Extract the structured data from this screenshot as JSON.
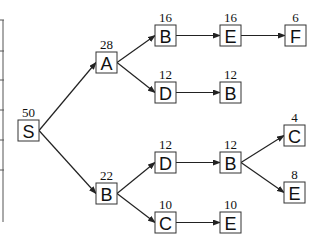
{
  "diagram": {
    "type": "tree",
    "direction": "left-to-right",
    "nodes": [
      {
        "id": "n0",
        "label": "S",
        "value": "50",
        "x": 18,
        "y": 120
      },
      {
        "id": "n1",
        "label": "A",
        "value": "28",
        "x": 96,
        "y": 52
      },
      {
        "id": "n2",
        "label": "B",
        "value": "22",
        "x": 96,
        "y": 183
      },
      {
        "id": "n3",
        "label": "B",
        "value": "16",
        "x": 155,
        "y": 25
      },
      {
        "id": "n4",
        "label": "D",
        "value": "12",
        "x": 155,
        "y": 82
      },
      {
        "id": "n5",
        "label": "E",
        "value": "16",
        "x": 220,
        "y": 25
      },
      {
        "id": "n6",
        "label": "F",
        "value": "6",
        "x": 285,
        "y": 25
      },
      {
        "id": "n7",
        "label": "B",
        "value": "12",
        "x": 220,
        "y": 82
      },
      {
        "id": "n8",
        "label": "D",
        "value": "12",
        "x": 155,
        "y": 152
      },
      {
        "id": "n9",
        "label": "B",
        "value": "12",
        "x": 220,
        "y": 152
      },
      {
        "id": "n10",
        "label": "C",
        "value": "4",
        "x": 284,
        "y": 125
      },
      {
        "id": "n11",
        "label": "E",
        "value": "8",
        "x": 284,
        "y": 182
      },
      {
        "id": "n12",
        "label": "C",
        "value": "10",
        "x": 155,
        "y": 212
      },
      {
        "id": "n13",
        "label": "E",
        "value": "10",
        "x": 220,
        "y": 212
      }
    ],
    "edges": [
      {
        "from": "n0",
        "to": "n1"
      },
      {
        "from": "n0",
        "to": "n2"
      },
      {
        "from": "n1",
        "to": "n3"
      },
      {
        "from": "n1",
        "to": "n4"
      },
      {
        "from": "n3",
        "to": "n5"
      },
      {
        "from": "n5",
        "to": "n6"
      },
      {
        "from": "n4",
        "to": "n7"
      },
      {
        "from": "n2",
        "to": "n8"
      },
      {
        "from": "n2",
        "to": "n12"
      },
      {
        "from": "n8",
        "to": "n9"
      },
      {
        "from": "n9",
        "to": "n10"
      },
      {
        "from": "n9",
        "to": "n11"
      },
      {
        "from": "n12",
        "to": "n13"
      }
    ],
    "node_size": 21,
    "colors": {
      "stroke": "#333333",
      "text": "#111111",
      "background": "#ffffff"
    }
  },
  "cropped_table": {
    "x": 3,
    "y_top": 20,
    "y_bottom": 222,
    "row_lines_y": [
      20,
      51,
      80,
      110,
      140,
      170
    ]
  }
}
